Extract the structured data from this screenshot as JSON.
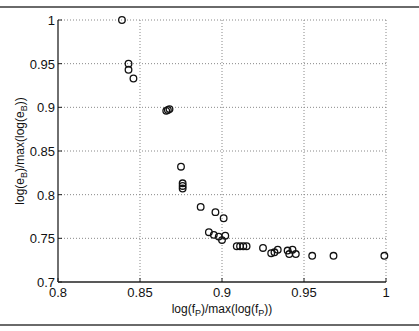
{
  "chart_data": {
    "type": "scatter",
    "title": "",
    "xlabel": "log(f_P)/max(log(f_P))",
    "ylabel": "log(e_B)/max(log(e_B))",
    "xlabel_parts": {
      "pre": "log(f",
      "sub1": "P",
      "mid": ")/max(log(f",
      "sub2": "P",
      "post": "))"
    },
    "ylabel_parts": {
      "pre": "log(e",
      "sub1": "B",
      "mid": ")/max(log(e",
      "sub2": "B",
      "post": "))"
    },
    "xlim": [
      0.8,
      1.0
    ],
    "ylim": [
      0.7,
      1.0
    ],
    "xticks": [
      0.8,
      0.85,
      0.9,
      0.95,
      1.0
    ],
    "xtick_labels": [
      "0.8",
      "0.85",
      "0.9",
      "0.95",
      "1"
    ],
    "yticks": [
      0.7,
      0.75,
      0.8,
      0.85,
      0.9,
      0.95,
      1.0
    ],
    "ytick_labels": [
      "0.7",
      "0.75",
      "0.8",
      "0.85",
      "0.9",
      "0.95",
      "1"
    ],
    "grid": true,
    "marker": "open-circle",
    "marker_color": "#111111",
    "series": [
      {
        "name": "points",
        "x": [
          0.839,
          0.843,
          0.843,
          0.846,
          0.866,
          0.867,
          0.868,
          0.875,
          0.876,
          0.876,
          0.876,
          0.887,
          0.896,
          0.901,
          0.892,
          0.895,
          0.898,
          0.9,
          0.902,
          0.909,
          0.911,
          0.913,
          0.915,
          0.925,
          0.93,
          0.932,
          0.934,
          0.94,
          0.941,
          0.943,
          0.945,
          0.955,
          0.968,
          0.999
        ],
        "y": [
          1.0,
          0.95,
          0.943,
          0.933,
          0.896,
          0.897,
          0.898,
          0.832,
          0.813,
          0.81,
          0.807,
          0.786,
          0.78,
          0.773,
          0.757,
          0.754,
          0.752,
          0.748,
          0.753,
          0.741,
          0.741,
          0.741,
          0.741,
          0.739,
          0.733,
          0.734,
          0.737,
          0.736,
          0.732,
          0.737,
          0.732,
          0.73,
          0.73,
          0.73
        ]
      }
    ]
  }
}
